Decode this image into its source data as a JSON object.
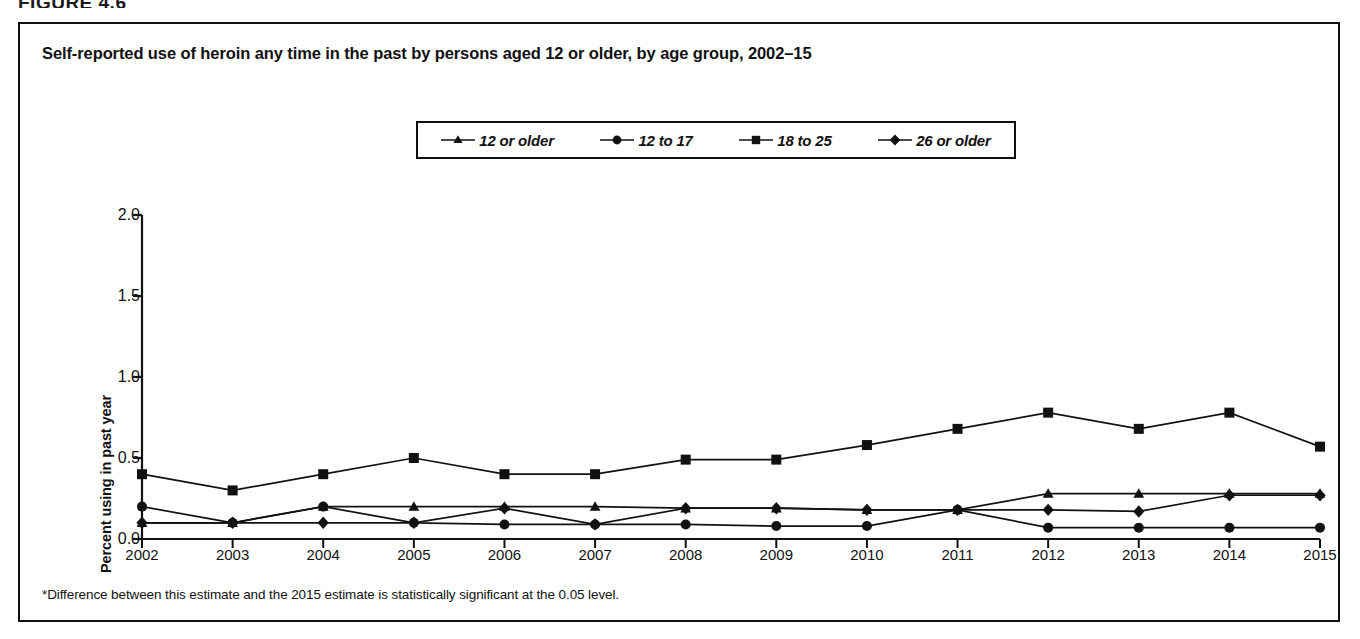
{
  "figure": {
    "label": "FIGURE 4.6",
    "title": "Self-reported use of heroin any time in the past by persons aged 12 or older, by age group, 2002–15",
    "footnote": "*Difference between this estimate and the 2015 estimate is statistically significant at the 0.05 level.",
    "bottom_caption": ""
  },
  "chart_data": {
    "type": "line",
    "title": "Self-reported use of heroin any time in the past by persons aged 12 or older, by age group, 2002–15",
    "xlabel": "",
    "ylabel": "Percent using in past year",
    "categories": [
      "2002",
      "2003",
      "2004",
      "2005",
      "2006",
      "2007",
      "2008",
      "2009",
      "2010",
      "2011",
      "2012",
      "2013",
      "2014",
      "2015"
    ],
    "x": [
      2002,
      2003,
      2004,
      2005,
      2006,
      2007,
      2008,
      2009,
      2010,
      2011,
      2012,
      2013,
      2014,
      2015
    ],
    "ylim": [
      0.0,
      2.0
    ],
    "ytick_labels": [
      "0.0",
      "0.5",
      "1.0",
      "1.5",
      "2.0"
    ],
    "yticks": [
      0.0,
      0.5,
      1.0,
      1.5,
      2.0
    ],
    "grid": false,
    "legend_position": "top-center",
    "series": [
      {
        "name": "12 or older",
        "marker": "triangle",
        "values": [
          0.1,
          0.1,
          0.2,
          0.2,
          0.2,
          0.2,
          0.19,
          0.19,
          0.18,
          0.18,
          0.28,
          0.28,
          0.28,
          0.28
        ]
      },
      {
        "name": "12 to 17",
        "marker": "circle",
        "values": [
          0.2,
          0.1,
          0.2,
          0.1,
          0.09,
          0.09,
          0.09,
          0.08,
          0.08,
          0.18,
          0.07,
          0.07,
          0.07,
          0.07
        ]
      },
      {
        "name": "18 to 25",
        "marker": "square",
        "values": [
          0.4,
          0.3,
          0.4,
          0.5,
          0.4,
          0.4,
          0.49,
          0.49,
          0.58,
          0.68,
          0.78,
          0.68,
          0.78,
          0.57
        ]
      },
      {
        "name": "26 or older",
        "marker": "diamond",
        "values": [
          0.1,
          0.1,
          0.1,
          0.1,
          0.19,
          0.09,
          0.19,
          0.19,
          0.18,
          0.18,
          0.18,
          0.17,
          0.27,
          0.27
        ]
      }
    ]
  },
  "colors": {
    "line": "#111111",
    "marker": "#111111",
    "axis": "#111111",
    "border": "#111111",
    "background": "#ffffff"
  }
}
